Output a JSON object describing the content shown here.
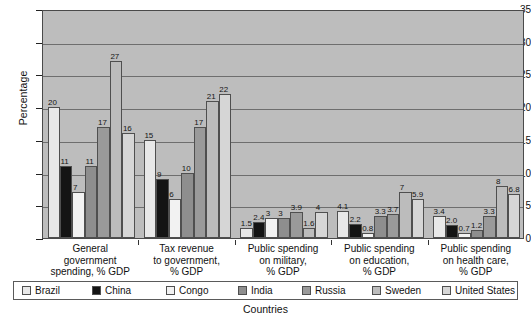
{
  "chart_data": {
    "type": "bar",
    "title": "",
    "xlabel": "Countries",
    "ylabel": "Percentage",
    "ylim": [
      0,
      35
    ],
    "yticks": [
      0,
      5,
      10,
      15,
      20,
      25,
      30,
      35
    ],
    "grid": true,
    "legend_position": "bottom",
    "categories": [
      "General government spending, % GDP",
      "Tax revenue to government, % GDP",
      "Public spending on military, % GDP",
      "Public spending on education, % GDP",
      "Public spending on health care, % GDP"
    ],
    "category_lines": [
      [
        "General",
        "government",
        "spending, % GDP"
      ],
      [
        "Tax revenue",
        "to government,",
        "% GDP"
      ],
      [
        "Public spending",
        "on military,",
        "% GDP"
      ],
      [
        "Public spending",
        "on education,",
        "% GDP"
      ],
      [
        "Public spending",
        "on health care,",
        "% GDP"
      ]
    ],
    "series": [
      {
        "name": "Brazil",
        "color": "#e8e8e8",
        "values": [
          20,
          15,
          1.5,
          4.1,
          3.4
        ],
        "labels": [
          "20",
          "15",
          "1.5",
          "4.1",
          "3.4"
        ]
      },
      {
        "name": "China",
        "color": "#141414",
        "values": [
          11,
          9,
          2.4,
          2.2,
          2.0
        ],
        "labels": [
          "11",
          "9",
          "2.4",
          "2.2",
          "2.0"
        ]
      },
      {
        "name": "Congo",
        "color": "#f2f2f2",
        "values": [
          7,
          6,
          3,
          0.8,
          0.7
        ],
        "labels": [
          "7",
          "6",
          "3",
          "0.8",
          "0.7"
        ]
      },
      {
        "name": "India",
        "color": "#8e8e8e",
        "values": [
          11,
          10,
          3,
          3.3,
          1.2
        ],
        "labels": [
          "11",
          "10",
          "3",
          "3.3",
          "1.2"
        ]
      },
      {
        "name": "Russia",
        "color": "#9a9a9a",
        "values": [
          17,
          17,
          3.9,
          3.7,
          3.3
        ],
        "labels": [
          "17",
          "17",
          "3.9",
          "3.7",
          "3.3"
        ]
      },
      {
        "name": "Sweden",
        "color": "#bcbcbc",
        "values": [
          27,
          21,
          1.6,
          7,
          8
        ],
        "labels": [
          "27",
          "21",
          "1.6",
          "7",
          "8"
        ]
      },
      {
        "name": "United States",
        "color": "#d6d6d6",
        "values": [
          16,
          22,
          4,
          5.9,
          6.8
        ],
        "labels": [
          "16",
          "22",
          "4",
          "5.9",
          "6.8"
        ]
      }
    ]
  },
  "axis": {
    "y_title": "Percentage",
    "x_title": "Countries"
  },
  "colors": {
    "plot_background": "#bdbdbd",
    "gridline": "#6e6e6e",
    "axis": "#222222",
    "bar_border": "#4f4f4f",
    "legend_border": "#5a5a5a",
    "page_background": "#ffffff"
  }
}
